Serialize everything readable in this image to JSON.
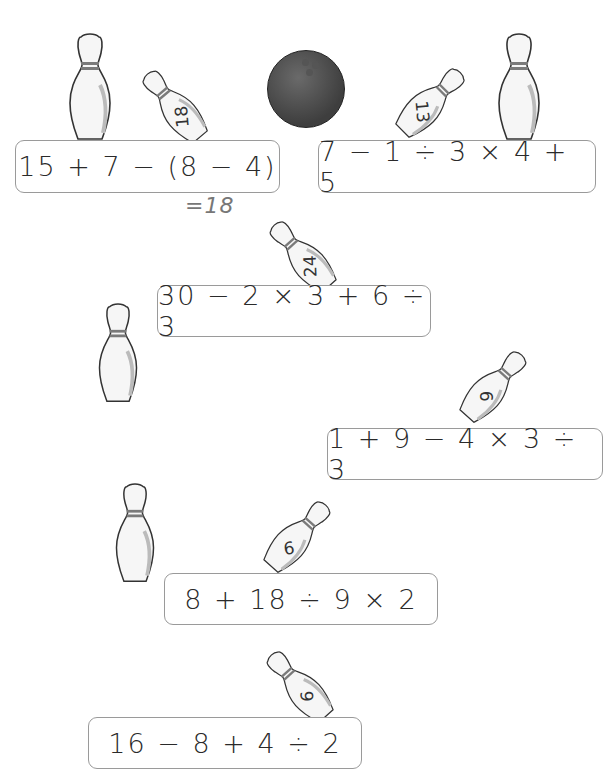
{
  "worksheet": {
    "problems": [
      {
        "id": 1,
        "expression": "15 + 7 − (8 − 4)",
        "pin_label": "18",
        "annotation": "=18"
      },
      {
        "id": 2,
        "expression": "7 − 1 ÷ 3 × 4 + 5",
        "pin_label": "13"
      },
      {
        "id": 3,
        "expression": "30 − 2 × 3 + 6 ÷ 3",
        "pin_label": "24"
      },
      {
        "id": 4,
        "expression": "1 + 9 − 4 × 3 ÷ 3",
        "pin_label": "6"
      },
      {
        "id": 5,
        "expression": "8 + 18 ÷ 9 × 2",
        "pin_label": "9"
      },
      {
        "id": 6,
        "expression": "16 − 8 + 4 ÷ 2",
        "pin_label": "6"
      }
    ],
    "decorations": [
      "standing-pin",
      "standing-pin",
      "standing-pin",
      "standing-pin",
      "bowling-ball"
    ]
  },
  "colors": {
    "pin_stripe": "#7a7a7a",
    "ball": "#4a4a4a",
    "box_border": "#9a9a9a",
    "annotation": "#777777"
  }
}
